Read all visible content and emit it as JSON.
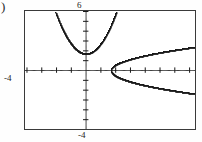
{
  "figure": {
    "part_label": ")",
    "frame": {
      "x": 24,
      "y": 10,
      "width": 172,
      "height": 120
    }
  },
  "labels": {
    "y_max": "6",
    "x_min": "-4",
    "y_min": "-4"
  },
  "chart_data": {
    "type": "line",
    "title": "",
    "xlabel": "",
    "ylabel": "",
    "grid": false,
    "legend": null,
    "axis_style": "graphing-calculator",
    "tick_marks": true,
    "x_tick_interval": 1,
    "y_tick_interval": 1,
    "xlim": [
      -4.1,
      7.4
    ],
    "ylim": [
      -6.0,
      6.0
    ],
    "window": {
      "Xmin": -4,
      "Xmax": 7.4,
      "Xscl": 1,
      "Ymin": -6,
      "Ymax": 6,
      "Yscl": 1
    },
    "axis_labels": {
      "top": "6",
      "left": "-4",
      "bottom": "-4"
    },
    "series": [
      {
        "name": "upward-parabola",
        "equation": "y = x^2 + 1.7",
        "style": "dotted",
        "vertex": [
          0,
          1.7
        ],
        "opens": "up",
        "a": 1.0,
        "x_range": [
          -2.05,
          2.05
        ],
        "points": [
          [
            -2.05,
            5.9
          ],
          [
            -1.95,
            5.5
          ],
          [
            -1.85,
            5.12
          ],
          [
            -1.75,
            4.76
          ],
          [
            -1.65,
            4.42
          ],
          [
            -1.55,
            4.1
          ],
          [
            -1.45,
            3.8
          ],
          [
            -1.35,
            3.52
          ],
          [
            -1.25,
            3.26
          ],
          [
            -1.15,
            3.02
          ],
          [
            -1.05,
            2.8
          ],
          [
            -0.95,
            2.6
          ],
          [
            -0.85,
            2.42
          ],
          [
            -0.75,
            2.26
          ],
          [
            -0.65,
            2.12
          ],
          [
            -0.55,
            2.0
          ],
          [
            -0.45,
            1.9
          ],
          [
            -0.35,
            1.82
          ],
          [
            -0.25,
            1.76
          ],
          [
            -0.15,
            1.72
          ],
          [
            -0.05,
            1.7
          ],
          [
            0.05,
            1.7
          ],
          [
            0.15,
            1.72
          ],
          [
            0.25,
            1.76
          ],
          [
            0.35,
            1.82
          ],
          [
            0.45,
            1.9
          ],
          [
            0.55,
            2.0
          ],
          [
            0.65,
            2.12
          ],
          [
            0.75,
            2.26
          ],
          [
            0.85,
            2.42
          ],
          [
            0.95,
            2.6
          ],
          [
            1.05,
            2.8
          ],
          [
            1.15,
            3.02
          ],
          [
            1.25,
            3.26
          ],
          [
            1.35,
            3.52
          ],
          [
            1.45,
            3.8
          ],
          [
            1.55,
            4.1
          ],
          [
            1.65,
            4.42
          ],
          [
            1.75,
            4.76
          ],
          [
            1.85,
            5.12
          ],
          [
            1.95,
            5.5
          ],
          [
            2.05,
            5.9
          ]
        ]
      },
      {
        "name": "rightward-parabola-upper",
        "equation": "y = sqrt(x - 1.7)",
        "style": "dotted",
        "vertex": [
          1.7,
          0
        ],
        "opens": "right",
        "branch": "upper",
        "x_range": [
          1.7,
          7.4
        ]
      },
      {
        "name": "rightward-parabola-lower",
        "equation": "y = -sqrt(x - 1.7)",
        "style": "dotted",
        "vertex": [
          1.7,
          0
        ],
        "opens": "right",
        "branch": "lower",
        "x_range": [
          1.7,
          7.4
        ]
      }
    ],
    "intersections": []
  }
}
